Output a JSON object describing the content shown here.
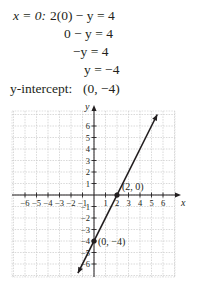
{
  "work": {
    "line1_label": "x = 0:",
    "line1_expr": "2(0) − y = 4",
    "line2": "0 − y = 4",
    "line3": "−y = 4",
    "line4": "y = −4",
    "intercept_label": "y-intercept:",
    "intercept_value": "(0, −4)"
  },
  "chart_data": {
    "type": "line",
    "title": "",
    "xlabel": "x",
    "ylabel": "y",
    "xlim": [
      -7,
      7
    ],
    "ylim": [
      -7,
      7
    ],
    "grid": true,
    "x_ticks": [
      -6,
      -5,
      -4,
      -3,
      -2,
      -1,
      1,
      2,
      3,
      4,
      5,
      6
    ],
    "y_ticks": [
      -6,
      -5,
      -4,
      -3,
      -2,
      -1,
      1,
      2,
      3,
      4,
      5,
      6
    ],
    "equation": "y = 2x - 4",
    "series": [
      {
        "name": "2x - y = 4",
        "x": [
          -1.4,
          5.5
        ],
        "y": [
          -6.8,
          7.0
        ]
      }
    ],
    "points": [
      {
        "x": 2,
        "y": 0,
        "label": "(2, 0)"
      },
      {
        "x": 0,
        "y": -4,
        "label": "(0, −4)"
      }
    ]
  }
}
